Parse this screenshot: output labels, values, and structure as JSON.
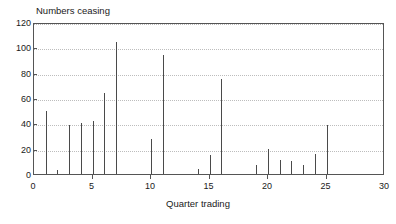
{
  "chart_data": {
    "type": "bar",
    "title": "Numbers ceasing",
    "xlabel": "Quarter trading",
    "ylabel": "",
    "xlim": [
      0,
      30
    ],
    "ylim": [
      0,
      120
    ],
    "grid": true,
    "legend": null,
    "xticks": [
      0,
      5,
      10,
      15,
      20,
      25,
      30
    ],
    "yticks": [
      0,
      20,
      40,
      60,
      80,
      100,
      120
    ],
    "x": [
      1,
      2,
      3,
      4,
      5,
      6,
      7,
      10,
      11,
      14,
      15,
      16,
      19,
      20,
      21,
      22,
      23,
      24,
      25
    ],
    "values": [
      50,
      3,
      39,
      40,
      42,
      64,
      104,
      28,
      94,
      4,
      15,
      75,
      7,
      20,
      11,
      10,
      7,
      16,
      39
    ],
    "bar_color": "#4a4a4a",
    "grid_color": "#bdbdbd",
    "axis_color": "#555555"
  }
}
